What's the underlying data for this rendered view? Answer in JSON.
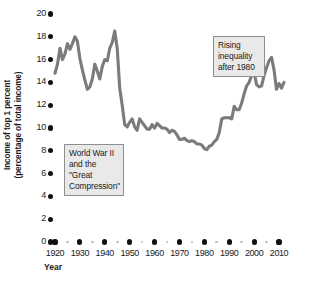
{
  "axes": {
    "y_title": "Income of top 1 percent (percentage of total income)",
    "x_title": "Year",
    "y_ticks": [
      "0",
      "2",
      "4",
      "6",
      "8",
      "10",
      "12",
      "14",
      "16",
      "18",
      "20"
    ],
    "x_ticks": [
      "1920",
      "1930",
      "1940",
      "1950",
      "1960",
      "1970",
      "1980",
      "1990",
      "2000",
      "2010"
    ]
  },
  "annotations": {
    "ww2": "World War II and the \"Great Compression\"",
    "rising": "Rising inequality after 1980"
  },
  "colors": {
    "line": "#7b7b7b",
    "axis_dot": "#111111",
    "minor_dot": "#bcbcbc",
    "annotation_bg": "#e9e9e9",
    "annotation_border": "#8e8e8e",
    "text": "#1a1a1a"
  },
  "chart_data": {
    "type": "line",
    "title": "",
    "xlabel": "Year",
    "ylabel": "Income of top 1 percent (percentage of total income)",
    "xlim": [
      1920,
      2012
    ],
    "ylim": [
      0,
      20
    ],
    "grid": false,
    "legend": "none",
    "series": [
      {
        "name": "Income share of top 1 percent",
        "x": [
          1920,
          1921,
          1922,
          1923,
          1924,
          1925,
          1926,
          1927,
          1928,
          1929,
          1930,
          1931,
          1932,
          1933,
          1934,
          1935,
          1936,
          1937,
          1938,
          1939,
          1940,
          1941,
          1942,
          1943,
          1944,
          1945,
          1946,
          1947,
          1948,
          1949,
          1950,
          1951,
          1952,
          1953,
          1954,
          1955,
          1956,
          1957,
          1958,
          1959,
          1960,
          1961,
          1962,
          1963,
          1964,
          1965,
          1966,
          1967,
          1968,
          1969,
          1970,
          1971,
          1972,
          1973,
          1974,
          1975,
          1976,
          1977,
          1978,
          1979,
          1980,
          1981,
          1982,
          1983,
          1984,
          1985,
          1986,
          1987,
          1988,
          1989,
          1990,
          1991,
          1992,
          1993,
          1994,
          1995,
          1996,
          1997,
          1998,
          1999,
          2000,
          2001,
          2002,
          2003,
          2004,
          2005,
          2006,
          2007,
          2008,
          2009,
          2010,
          2011,
          2012
        ],
        "y": [
          14.8,
          15.6,
          17.0,
          16.0,
          16.5,
          17.4,
          16.9,
          17.4,
          18.0,
          17.6,
          16.1,
          15.1,
          14.2,
          13.4,
          13.6,
          14.3,
          15.6,
          15.0,
          14.3,
          15.4,
          16.0,
          15.9,
          17.0,
          17.5,
          18.5,
          17.0,
          13.5,
          12.0,
          10.3,
          10.1,
          10.5,
          10.8,
          10.1,
          9.8,
          10.8,
          10.5,
          10.2,
          9.9,
          9.9,
          10.3,
          10.0,
          10.4,
          10.2,
          10.0,
          10.0,
          9.9,
          9.6,
          9.8,
          9.7,
          9.4,
          9.0,
          9.0,
          9.1,
          8.9,
          8.8,
          8.9,
          8.8,
          8.6,
          8.6,
          8.5,
          8.2,
          8.1,
          8.4,
          8.5,
          8.8,
          9.0,
          9.6,
          10.8,
          10.9,
          10.9,
          10.9,
          10.8,
          11.9,
          11.6,
          11.6,
          12.2,
          13.0,
          13.7,
          14.0,
          14.6,
          14.9,
          13.8,
          13.6,
          13.7,
          14.6,
          15.3,
          15.9,
          16.2,
          15.1,
          13.4,
          13.9,
          13.5,
          14.0
        ],
        "peak_1928": 18.0,
        "peak_1944": 18.5,
        "trough_1980": 8.2,
        "peak_2000": 14.9,
        "peak_2007": 16.2,
        "end_value": 14.0
      }
    ]
  }
}
